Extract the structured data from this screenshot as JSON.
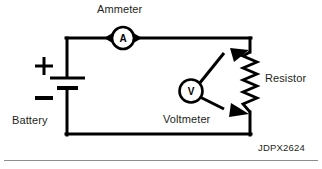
{
  "diagram": {
    "code": "JDPX2624",
    "labels": {
      "ammeter": "Ammeter",
      "battery": "Battery",
      "voltmeter": "Voltmeter",
      "resistor": "Resistor"
    },
    "symbols": {
      "ammeter_glyph": "A",
      "voltmeter_glyph": "V",
      "battery_positive": "+",
      "battery_negative": "−"
    },
    "colors": {
      "wire": "#000000",
      "text": "#231f20",
      "rule": "#8d8d8d",
      "background": "#ffffff"
    }
  }
}
